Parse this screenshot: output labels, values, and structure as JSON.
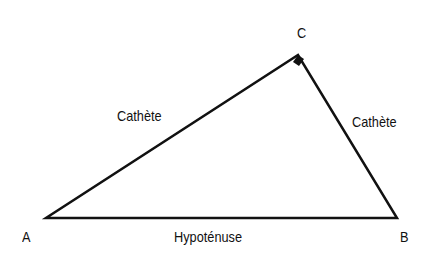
{
  "diagram": {
    "vertices": {
      "A": {
        "label": "A",
        "x": 46,
        "y": 218
      },
      "B": {
        "label": "B",
        "x": 397,
        "y": 218
      },
      "C": {
        "label": "C",
        "x": 298,
        "y": 55
      }
    },
    "right_angle_at": "C",
    "sides": {
      "AC": {
        "label": "Cathète"
      },
      "BC": {
        "label": "Cathète"
      },
      "AB": {
        "label": "Hypoténuse"
      }
    },
    "colors": {
      "stroke": "#111111",
      "background": "#ffffff"
    }
  }
}
